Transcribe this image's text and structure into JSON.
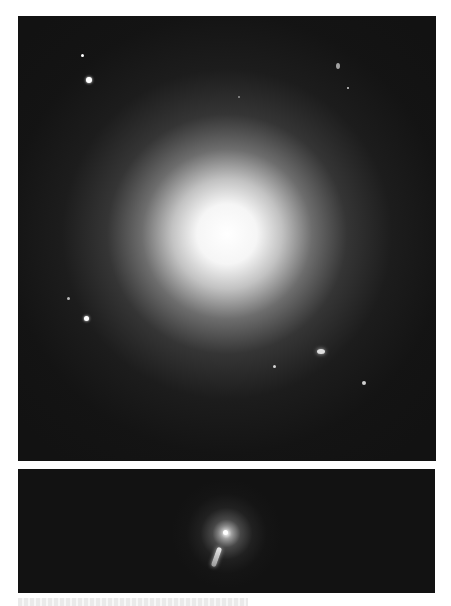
{
  "figure": {
    "panels": [
      {
        "id": "top",
        "description": "Wide field view of a large elliptical galaxy with surrounding stars",
        "bright_core": {
          "x": 230,
          "y": 235
        },
        "stars": [
          {
            "x": 82,
            "y": 55,
            "r": 1.5
          },
          {
            "x": 89,
            "y": 80,
            "r": 3
          },
          {
            "x": 338,
            "y": 67,
            "r": 2
          },
          {
            "x": 348,
            "y": 88,
            "r": 1.2
          },
          {
            "x": 239,
            "y": 97,
            "r": 1.2
          },
          {
            "x": 68,
            "y": 298,
            "r": 1.5
          },
          {
            "x": 86,
            "y": 318,
            "r": 2.5
          },
          {
            "x": 321,
            "y": 351,
            "r": 3
          },
          {
            "x": 274,
            "y": 366,
            "r": 1.5
          },
          {
            "x": 364,
            "y": 383,
            "r": 2
          }
        ]
      },
      {
        "id": "bottom",
        "description": "Short exposure of the galaxy core showing the jet",
        "bright_core": {
          "x": 226,
          "y": 533
        },
        "jet": {
          "from": {
            "x": 222,
            "y": 548
          },
          "to": {
            "x": 212,
            "y": 566
          }
        }
      }
    ],
    "caption": ""
  }
}
